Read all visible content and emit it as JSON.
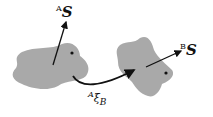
{
  "diagram": {
    "frame_a": {
      "superscript": "A",
      "symbol": "S"
    },
    "frame_b": {
      "superscript": "B",
      "symbol": "S"
    },
    "transform": {
      "superscript": "A",
      "symbol": "ξ",
      "subscript": "B"
    },
    "colors": {
      "blob": "#a9a9a9",
      "line": "#111111"
    }
  }
}
